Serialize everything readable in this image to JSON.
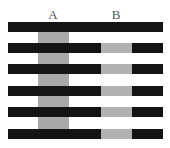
{
  "labels": {
    "a": "A",
    "b": "B"
  },
  "colors": {
    "bar": "#141414",
    "gray_a": "#a9a9a9",
    "gray_b": "#b1b1b1",
    "background": "#ffffff"
  },
  "figure": {
    "name": "White's illusion",
    "bars": 6,
    "column_a_rows": "gaps between bars",
    "column_b_rows": [
      2,
      3,
      4,
      5,
      6
    ]
  }
}
